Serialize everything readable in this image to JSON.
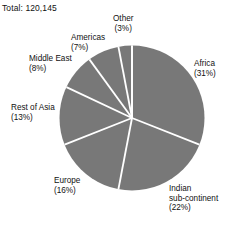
{
  "chart_data": {
    "type": "pie",
    "title": "Total: 120,145",
    "total_label": "Total:",
    "total_value": "120,145",
    "xlabel": "",
    "ylabel": "",
    "legend_position": "outside-labels",
    "grid": false,
    "slice_fill_color": "#787878",
    "slice_separator_color": "#ffffff",
    "text_color": "#111111",
    "background_color": "#ffffff",
    "start_angle_deg": 0,
    "direction": "clockwise",
    "categories": [
      "Africa",
      "Indian sub-continent",
      "Europe",
      "Rest of Asia",
      "Middle East",
      "Americas",
      "Other"
    ],
    "values": [
      31,
      22,
      16,
      13,
      8,
      7,
      3
    ],
    "unit": "%",
    "slices": [
      {
        "name": "Africa",
        "value": 31,
        "pct_label": "(31%)",
        "label_lines": [
          "Africa"
        ]
      },
      {
        "name": "Indian sub-continent",
        "value": 22,
        "pct_label": "(22%)",
        "label_lines": [
          "Indian",
          "sub-continent"
        ]
      },
      {
        "name": "Europe",
        "value": 16,
        "pct_label": "(16%)",
        "label_lines": [
          "Europe"
        ]
      },
      {
        "name": "Rest of Asia",
        "value": 13,
        "pct_label": "(13%)",
        "label_lines": [
          "Rest of Asia"
        ]
      },
      {
        "name": "Middle East",
        "value": 8,
        "pct_label": "(8%)",
        "label_lines": [
          "Middle East"
        ]
      },
      {
        "name": "Americas",
        "value": 7,
        "pct_label": "(7%)",
        "label_lines": [
          "Americas"
        ]
      },
      {
        "name": "Other",
        "value": 3,
        "pct_label": "(3%)",
        "label_lines": [
          "Other"
        ]
      }
    ]
  },
  "labels": {
    "africa": {
      "name": "Africa",
      "pct": "(31%)"
    },
    "indian": {
      "line1": "Indian",
      "line2": "sub-continent",
      "pct": "(22%)"
    },
    "europe": {
      "name": "Europe",
      "pct": "(16%)"
    },
    "rest_of_asia": {
      "name": "Rest of Asia",
      "pct": "(13%)"
    },
    "middle_east": {
      "name": "Middle East",
      "pct": "(8%)"
    },
    "americas": {
      "name": "Americas",
      "pct": "(7%)"
    },
    "other": {
      "name": "Other",
      "pct": "(3%)"
    }
  }
}
